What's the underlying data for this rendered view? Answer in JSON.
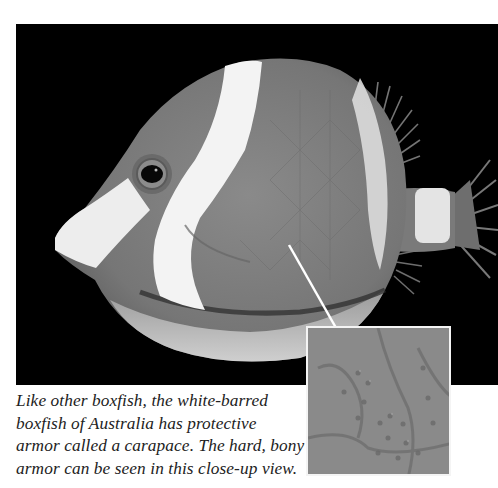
{
  "page": {
    "subject": "white-barred boxfish",
    "photo": {
      "background_color": "#000000",
      "body_gray": "#7d7d7d",
      "bar_color": "#f2f2f2",
      "icon": "boxfish-photo"
    },
    "inset": {
      "icon": "carapace-closeup",
      "border_color": "#f4f4f4",
      "texture_gray": "#8a8a8a"
    },
    "arrow": {
      "color": "#ffffff",
      "from": [
        289,
        245
      ],
      "to": [
        348,
        350
      ]
    },
    "caption": {
      "lines": [
        "Like other boxfish, the white-barred",
        "boxfish of Australia has protective",
        "armor called a carapace. The hard, bony",
        "armor can be seen in this close-up view."
      ]
    }
  }
}
